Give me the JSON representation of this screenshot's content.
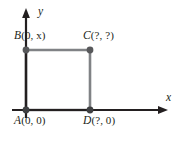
{
  "figure": {
    "axes": {
      "x_label": "x",
      "y_label": "y",
      "x_axis_name": "x-axis",
      "y_axis_name": "y-axis",
      "arrow_x": "arrowhead-right",
      "arrow_y": "arrowhead-up"
    },
    "colors": {
      "axis": "#231f20",
      "shape_edge": "#808285",
      "vertex": "#58595b",
      "text": "#231f20",
      "background": "#ffffff"
    },
    "shape": {
      "name": "square-ABCD",
      "vertex_order": [
        "A",
        "B",
        "C",
        "D"
      ]
    },
    "points": [
      {
        "id": "A",
        "name": "vertex-a",
        "letter": "A",
        "coordinates": "(0, 0)",
        "px": 26,
        "py": 110
      },
      {
        "id": "B",
        "name": "vertex-b",
        "letter": "B",
        "coordinates": "(0, x)",
        "px": 26,
        "py": 50
      },
      {
        "id": "C",
        "name": "vertex-c",
        "letter": "C",
        "coordinates": "(?, ?)",
        "px": 90,
        "py": 50
      },
      {
        "id": "D",
        "name": "vertex-d",
        "letter": "D",
        "coordinates": "(?, 0)",
        "px": 90,
        "py": 110
      }
    ]
  }
}
